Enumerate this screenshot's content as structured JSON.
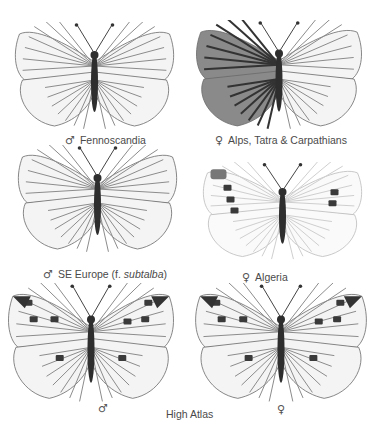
{
  "plate": {
    "specimens": [
      {
        "id": "s1",
        "sex": "male",
        "sex_symbol": "♂",
        "label": "Fennoscandia",
        "pattern": "light-veined"
      },
      {
        "id": "s2",
        "sex": "female",
        "sex_symbol": "♀",
        "label": "Alps, Tatra & Carpathians",
        "pattern": "dark-half"
      },
      {
        "id": "s3",
        "sex": "male",
        "sex_symbol": "♂",
        "label_main": "SE Europe (f. ",
        "label_italic": "subtalba",
        "label_end": ")",
        "pattern": "light-veined"
      },
      {
        "id": "s4",
        "sex": "female",
        "sex_symbol": "♀",
        "label": "Algeria",
        "pattern": "pale-spotted"
      },
      {
        "id": "s5",
        "sex": "male",
        "sex_symbol": "♂",
        "pattern": "spotted-veined"
      },
      {
        "id": "s6",
        "sex": "female",
        "sex_symbol": "♀",
        "pattern": "spotted-veined"
      }
    ],
    "shared_label": "High Atlas"
  }
}
